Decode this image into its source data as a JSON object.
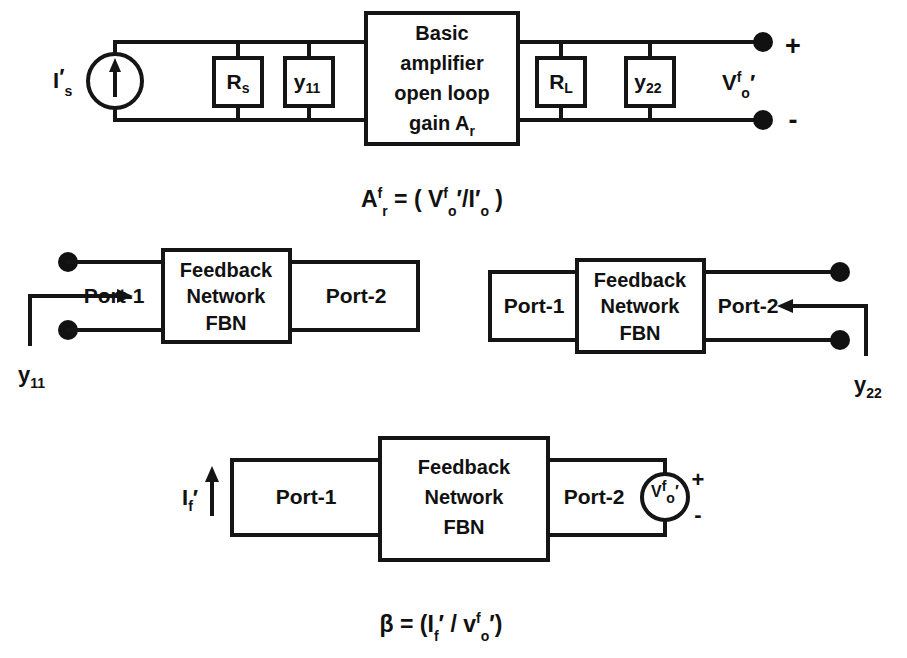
{
  "figure": {
    "background_color": "#ffffff",
    "line_color": "#151515"
  },
  "top_circuit": {
    "name": "basic-amplifier-equivalent-circuit",
    "source_label": {
      "base": "I",
      "prime": "′",
      "sub": "s"
    },
    "shunt_input_boxes": [
      {
        "base": "R",
        "sub": "s"
      },
      {
        "base": "y",
        "sub": "11"
      }
    ],
    "amplifier_box": {
      "lines": [
        "Basic",
        "amplifier",
        "open loop",
        "gain A"
      ],
      "gain_sub": "r"
    },
    "shunt_output_boxes": [
      {
        "base": "R",
        "sub": "L"
      },
      {
        "base": "y",
        "sub": "22"
      }
    ],
    "output_label": {
      "base": "V",
      "sup": "f",
      "sub": "o",
      "prime": "′"
    },
    "terminal_plus": "+",
    "terminal_minus": "-"
  },
  "equation_top": {
    "name": "closed-loop-transresistance-gain",
    "lhs_base": "A",
    "lhs_sup": "f",
    "lhs_sub": "r",
    "equals": "=",
    "open_paren": "(",
    "num_base": "V",
    "num_sup": "f",
    "num_sub": "o",
    "num_prime": "′",
    "slash": "/",
    "den_base": "I",
    "den_prime": "′",
    "den_sub": "o",
    "close_paren": ")",
    "plain_text": "Aᶠr = ( Vᶠo′ / I′o )"
  },
  "middle_left_diagram": {
    "name": "y11-measurement-two-port",
    "port1_label": "Port-1",
    "port2_label": "Port-2",
    "fbn_lines": [
      "Feedback",
      "Network",
      "FBN"
    ],
    "parameter_label": {
      "base": "y",
      "sub": "11"
    },
    "arrow_direction": "right",
    "port2_state": "short-circuited"
  },
  "middle_right_diagram": {
    "name": "y22-measurement-two-port",
    "port1_label": "Port-1",
    "port2_label": "Port-2",
    "fbn_lines": [
      "Feedback",
      "Network",
      "FBN"
    ],
    "parameter_label": {
      "base": "y",
      "sub": "22"
    },
    "arrow_direction": "left",
    "port1_state": "short-circuited"
  },
  "bottom_diagram": {
    "name": "beta-measurement-two-port",
    "port1_label": "Port-1",
    "port2_label": "Port-2",
    "fbn_lines": [
      "Feedback",
      "Network",
      "FBN"
    ],
    "feedback_current_label": {
      "base": "I",
      "sub": "f",
      "prime": "′"
    },
    "source_label": {
      "base": "V",
      "sup": "f",
      "sub": "o",
      "prime": "′"
    },
    "source_plus": "+",
    "source_minus": "-",
    "arrow_direction": "up"
  },
  "equation_bottom": {
    "name": "feedback-factor-beta",
    "lhs": "β",
    "equals": "=",
    "open_paren": "(",
    "num_base": "I",
    "num_sub": "f",
    "num_prime": "′",
    "slash": "/",
    "den_base": "v",
    "den_sup": "f",
    "den_sub": "o",
    "den_prime": "′",
    "close_paren": ")",
    "plain_text": "β = (I f′ / vᶠo′)"
  }
}
